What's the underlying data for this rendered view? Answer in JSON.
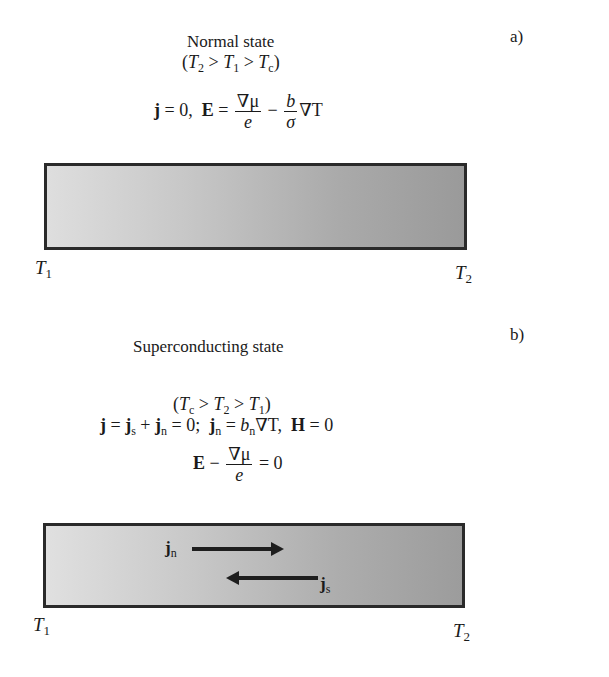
{
  "panel_a": {
    "label": "a)",
    "title": "Normal state",
    "condition": {
      "open": "(",
      "t2": "T",
      "t2_sub": "2",
      "gt1": " > ",
      "t1": "T",
      "t1_sub": "1",
      "gt2": " > ",
      "tc": "T",
      "tc_sub": "c",
      "close": ")"
    },
    "equation": {
      "j": "j",
      "eq_zero": " = 0,  ",
      "E": "E",
      "eq": " = ",
      "frac1_num": "∇μ",
      "frac1_den": "e",
      "minus": " − ",
      "frac2_num": "b",
      "frac2_den": "σ",
      "tail": "∇T"
    },
    "left_label": {
      "main": "T",
      "sub": "1"
    },
    "right_label": {
      "main": "T",
      "sub": "2"
    }
  },
  "panel_b": {
    "label": "b)",
    "title": "Superconducting state",
    "condition": {
      "open": "(",
      "tc": "T",
      "tc_sub": "c",
      "gt1": " > ",
      "t2": "T",
      "t2_sub": "2",
      "gt2": " > ",
      "t1": "T",
      "t1_sub": "1",
      "close": ")"
    },
    "equation1": {
      "j": "j",
      "eq": " = ",
      "js": "j",
      "js_sub": "s",
      "plus": " + ",
      "jn": "j",
      "jn_sub": "n",
      "eq_zero": " = 0;  ",
      "jn2": "j",
      "jn2_sub": "n",
      "eq2": " = ",
      "bn": "b",
      "bn_sub": "n",
      "grad": "∇T,  ",
      "H": "H",
      "eq_zero2": " = 0"
    },
    "equation2": {
      "E": "E",
      "minus": " − ",
      "frac_num": "∇μ",
      "frac_den": "e",
      "eq_zero": " = 0"
    },
    "currents": {
      "normal": {
        "main": "j",
        "sub": "n",
        "direction": "right"
      },
      "super": {
        "main": "j",
        "sub": "s",
        "direction": "left"
      }
    },
    "left_label": {
      "main": "T",
      "sub": "1"
    },
    "right_label": {
      "main": "T",
      "sub": "2"
    }
  },
  "colors": {
    "bar_left": "#dedede",
    "bar_right": "#9a9a9a",
    "border": "#2a2a2a",
    "text": "#1a1a1a"
  }
}
